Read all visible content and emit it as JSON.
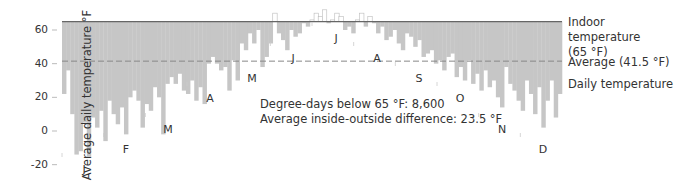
{
  "chart_data": {
    "type": "bar",
    "title": "",
    "ylabel": "Average daily temperature °F",
    "xlabel": "",
    "ylim": [
      -25,
      72
    ],
    "yticks": [
      60,
      40,
      20,
      0,
      -20
    ],
    "reference_lines": [
      {
        "name": "Indoor temperature",
        "value": 65,
        "style": "solid"
      },
      {
        "name": "Average",
        "value": 41.5,
        "style": "dashed"
      }
    ],
    "legend": [
      {
        "label": "Indoor temperature",
        "sub": "(65 °F)"
      },
      {
        "label": "Average (41.5 °F)"
      },
      {
        "label": "Daily temperature"
      }
    ],
    "annotations": [
      "Degree-days below 65 °F: 8,600",
      "Average inside-outside difference: 23.5 °F"
    ],
    "months": [
      {
        "label": "J",
        "x": 84,
        "y": 163
      },
      {
        "label": "F",
        "x": 126,
        "y": 143
      },
      {
        "label": "M",
        "x": 168,
        "y": 123
      },
      {
        "label": "A",
        "x": 210,
        "y": 92
      },
      {
        "label": "M",
        "x": 252,
        "y": 72
      },
      {
        "label": "J",
        "x": 293,
        "y": 52
      },
      {
        "label": "J",
        "x": 336,
        "y": 32
      },
      {
        "label": "A",
        "x": 377,
        "y": 52
      },
      {
        "label": "S",
        "x": 419,
        "y": 72
      },
      {
        "label": "O",
        "x": 460,
        "y": 92
      },
      {
        "label": "N",
        "x": 502,
        "y": 123
      },
      {
        "label": "D",
        "x": 543,
        "y": 143
      }
    ],
    "sample_interval_days": 3,
    "daily_temperature": [
      22,
      36,
      10,
      -14,
      -12,
      5,
      -16,
      8,
      2,
      12,
      -6,
      18,
      10,
      4,
      14,
      -2,
      20,
      24,
      18,
      2,
      16,
      12,
      26,
      20,
      -2,
      28,
      32,
      28,
      34,
      24,
      22,
      30,
      18,
      26,
      16,
      40,
      44,
      40,
      36,
      38,
      24,
      42,
      30,
      52,
      48,
      58,
      52,
      60,
      38,
      44,
      52,
      70,
      58,
      54,
      48,
      60,
      56,
      58,
      64,
      62,
      66,
      70,
      68,
      72,
      64,
      66,
      70,
      68,
      60,
      62,
      58,
      66,
      70,
      62,
      68,
      64,
      58,
      62,
      54,
      56,
      60,
      52,
      48,
      58,
      56,
      50,
      54,
      44,
      46,
      48,
      40,
      42,
      36,
      44,
      46,
      32,
      38,
      30,
      42,
      28,
      34,
      24,
      36,
      26,
      30,
      20,
      14,
      38,
      28,
      24,
      18,
      12,
      30,
      22,
      10,
      26,
      2,
      18,
      30,
      8,
      22
    ]
  }
}
